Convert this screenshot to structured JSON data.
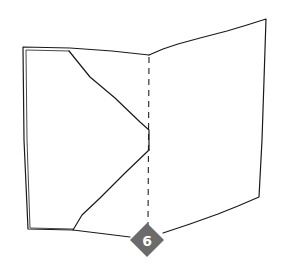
{
  "diagram": {
    "step": {
      "number": "6",
      "badge_color": "#6b6b6b",
      "text_color": "#ffffff"
    },
    "stroke_color": "#1a1a1a",
    "elements": [
      "left-panel-with-folded-flap",
      "right-panel",
      "vertical-dashed-fold-line",
      "step-number-diamond-badge"
    ]
  }
}
